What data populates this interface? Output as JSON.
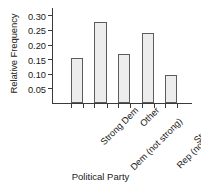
{
  "chart_data": {
    "type": "bar",
    "title": "",
    "xlabel": "Political Party",
    "ylabel": "Relative Frequency",
    "categories": [
      "Strong Dem",
      "Dem (not strong)",
      "Other",
      "Rep (not strong)",
      "Strong Rep"
    ],
    "values": [
      0.153,
      0.277,
      0.168,
      0.238,
      0.095
    ],
    "ylim": [
      0,
      0.325
    ],
    "yticks": [
      0.05,
      0.1,
      0.15,
      0.2,
      0.25,
      0.3
    ],
    "ytick_labels": [
      "0.05",
      "0.10",
      "0.15",
      "0.20",
      "0.25",
      "0.30"
    ],
    "grid": false,
    "legend": false,
    "bar_fill_color": "#ededed",
    "bar_border_color": "#5c5c5c",
    "axis_color": "#3a3a3a"
  }
}
